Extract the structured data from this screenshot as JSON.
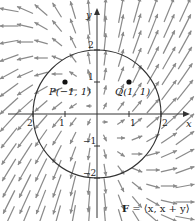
{
  "figure": {
    "field_label": "F = ⟨x, x + y⟩",
    "field_label_bold": "F",
    "field_label_rest": " = ⟨x, x + y⟩",
    "axes": {
      "x_label": "x",
      "y_label": "y"
    },
    "x_ticks": [
      {
        "value": -2,
        "label": "2"
      },
      {
        "value": -1,
        "label": "1"
      },
      {
        "value": 1,
        "label": "1"
      },
      {
        "value": 2,
        "label": "2"
      }
    ],
    "y_ticks": [
      {
        "value": 2,
        "label": "2"
      },
      {
        "value": 1,
        "label": "1"
      },
      {
        "value": -1,
        "label": "−1"
      },
      {
        "value": -2,
        "label": "−2"
      }
    ],
    "circle": {
      "center": [
        0,
        0
      ],
      "radius": 2
    },
    "points": [
      {
        "name": "P",
        "label": "P(−1, 1)",
        "x": -1,
        "y": 1
      },
      {
        "name": "Q",
        "label": "Q(1, 1)",
        "x": 1,
        "y": 1
      }
    ],
    "vector_field": {
      "Fx": "x",
      "Fy": "x + y",
      "grid_step": 0.5,
      "x_range": [
        -2.75,
        2.75
      ],
      "y_range": [
        -3.25,
        3.25
      ]
    },
    "colors": {
      "arrow": "#8a8a8a",
      "axis": "#333333",
      "circle": "#333333",
      "point": "#111111"
    }
  }
}
